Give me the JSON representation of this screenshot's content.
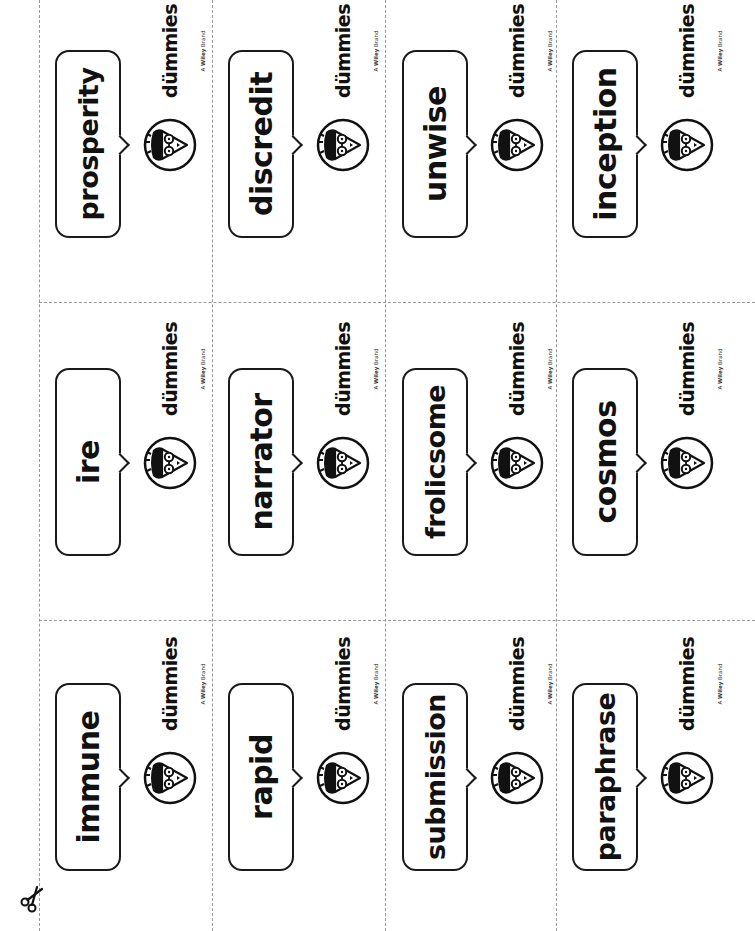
{
  "sheet": {
    "title": "Vocabulary flashcards",
    "brand": {
      "prefix": "for",
      "name": "dümmies",
      "tagline_prefix": "A ",
      "tagline_brand": "Wiley",
      "tagline_suffix": " Brand",
      "mark": "®"
    },
    "scissors_icon": "scissors-icon",
    "colors": {
      "ink": "#111111",
      "cut_line": "#9a9a9a",
      "paper": "#ffffff"
    }
  },
  "cards": [
    {
      "word": "prosperity",
      "col": 0,
      "row": 0
    },
    {
      "word": "discredit",
      "col": 1,
      "row": 0
    },
    {
      "word": "unwise",
      "col": 2,
      "row": 0
    },
    {
      "word": "inception",
      "col": 3,
      "row": 0
    },
    {
      "word": "ire",
      "col": 0,
      "row": 1
    },
    {
      "word": "narrator",
      "col": 1,
      "row": 1
    },
    {
      "word": "frolicsome",
      "col": 2,
      "row": 1
    },
    {
      "word": "cosmos",
      "col": 3,
      "row": 1
    },
    {
      "word": "immune",
      "col": 0,
      "row": 2
    },
    {
      "word": "rapid",
      "col": 1,
      "row": 2
    },
    {
      "word": "submission",
      "col": 2,
      "row": 2
    },
    {
      "word": "paraphrase",
      "col": 3,
      "row": 2
    }
  ]
}
